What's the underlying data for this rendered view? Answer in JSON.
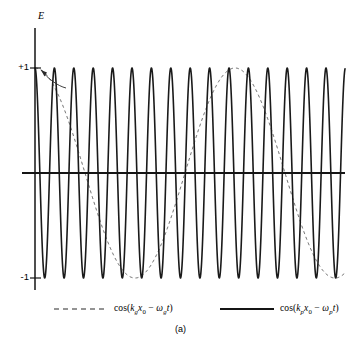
{
  "figure": {
    "caption": "(a)",
    "y_axis_label": "E",
    "tick_labels": {
      "positive_one": "+1",
      "negative_one": "-1"
    }
  },
  "legend": {
    "position": "bottom",
    "entries": [
      {
        "style": "dashed",
        "name": "group-wave",
        "text": "cos(kgx0 - ωgt)",
        "prefix": "cos(",
        "k_symbol": "k",
        "k_sub": "g",
        "x_symbol": "x",
        "x_sub": "0",
        "minus": " − ",
        "omega_symbol": "ω",
        "omega_sub": "g",
        "t_symbol": "t",
        "suffix": ")"
      },
      {
        "style": "solid",
        "name": "phase-wave",
        "text": "cos(kpx0 - ωpt)",
        "prefix": "cos(",
        "k_symbol": "k",
        "k_sub": "p",
        "x_symbol": "x",
        "x_sub": "0",
        "minus": " − ",
        "omega_symbol": "ω",
        "omega_sub": "p",
        "t_symbol": "t",
        "suffix": ")"
      }
    ]
  },
  "chart_data": {
    "type": "line",
    "title": "",
    "subtitle": "",
    "xlabel": "",
    "ylabel": "E",
    "caption": "(a)",
    "grid": false,
    "legend_position": "bottom",
    "xlim": [
      0,
      1
    ],
    "ylim": [
      -1.25,
      1.25
    ],
    "y_ticks": [
      1,
      -1
    ],
    "y_tick_labels": [
      "+1",
      "-1"
    ],
    "x_ticks": [],
    "axes": {
      "vertical_axis_x_fraction": 0.0,
      "horizontal_axis_y_value": 0,
      "vertical_axis_top_value": 1.38,
      "vertical_axis_bottom_value": -1.12
    },
    "geometry_px": {
      "axis_x": 35,
      "axis_top_y": 28,
      "axis_bottom_y": 290,
      "zero_y": 173,
      "plus_one_y": 68,
      "minus_one_y": 278,
      "x_start": 35,
      "x_end": 345,
      "h_axis_left_x": 22,
      "h_axis_right_x": 345,
      "amplitude_px": 105
    },
    "series": [
      {
        "name": "cos(kpx0 - ωpt)",
        "label": "phase-wave",
        "style": "solid",
        "color": "#1a1a1a",
        "linewidth": 1.6,
        "form": "cosine",
        "amplitude": 1.0,
        "phase_deg": 0,
        "period_px": 19.4,
        "cycles_visible": 16,
        "description": "fast carrier oscillation, starts at +1 at the vertical axis"
      },
      {
        "name": "cos(kgx0 - ωgt)",
        "label": "group-wave",
        "style": "dashed",
        "color": "#3a3a3a",
        "linewidth": 0.8,
        "dash_pattern": [
          3,
          3
        ],
        "form": "cosine",
        "amplitude": 1.0,
        "phase_deg": 0,
        "period_px": 200,
        "cycles_visible": 1.55,
        "minimum_px_x": 135,
        "maximum_px_x": 235,
        "description": "slow envelope-like cosine, starts at +1, minimum near x=135 px, maximum near x=235 px"
      }
    ],
    "annotations": [
      {
        "name": "plus-one-arrow",
        "type": "curved-arrow",
        "from_px": [
          62,
          84
        ],
        "to_px": [
          40,
          69
        ],
        "description": "small curved arrow pointing from the dashed curve up to the +1 tick"
      }
    ]
  }
}
